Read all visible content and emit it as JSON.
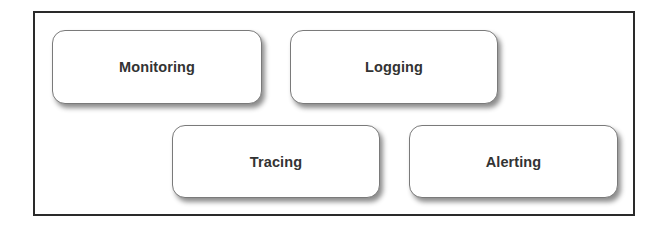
{
  "diagram": {
    "type": "block-layout",
    "frame": {
      "border_color": "#2a2a2a",
      "background": "#ffffff"
    },
    "nodes": [
      {
        "id": "monitoring",
        "label": "Monitoring",
        "row": 1,
        "position": 1
      },
      {
        "id": "logging",
        "label": "Logging",
        "row": 1,
        "position": 2
      },
      {
        "id": "tracing",
        "label": "Tracing",
        "row": 2,
        "position": 1
      },
      {
        "id": "alerting",
        "label": "Alerting",
        "row": 2,
        "position": 2
      }
    ],
    "edges": []
  }
}
